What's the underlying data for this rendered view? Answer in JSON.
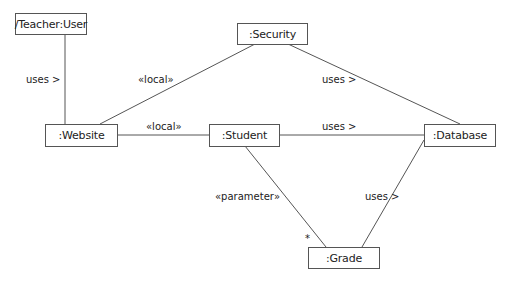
{
  "diagram": {
    "type": "UML communication/object diagram",
    "nodes": {
      "teacher": {
        "label": "/Teacher:User"
      },
      "security": {
        "label": ":Security"
      },
      "website": {
        "label": ":Website"
      },
      "student": {
        "label": ":Student"
      },
      "database": {
        "label": ":Database"
      },
      "grade": {
        "label": ":Grade"
      }
    },
    "edges": {
      "teacher_website": {
        "label": "uses >"
      },
      "security_website": {
        "label": "«local»"
      },
      "security_database": {
        "label": "uses >"
      },
      "website_student": {
        "label": "«local»"
      },
      "student_database": {
        "label": "uses >"
      },
      "student_grade": {
        "label": "«parameter»",
        "multiplicity": "*"
      },
      "database_grade": {
        "label": "uses >"
      }
    }
  }
}
